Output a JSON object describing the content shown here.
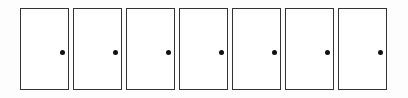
{
  "doors": [
    {
      "id": 1,
      "knob": "right"
    },
    {
      "id": 2,
      "knob": "right"
    },
    {
      "id": 3,
      "knob": "right"
    },
    {
      "id": 4,
      "knob": "right"
    },
    {
      "id": 5,
      "knob": "right"
    },
    {
      "id": 6,
      "knob": "right"
    },
    {
      "id": 7,
      "knob": "right"
    }
  ],
  "colors": {
    "border": "#333333",
    "knob": "#111111",
    "background": "#ffffff"
  }
}
